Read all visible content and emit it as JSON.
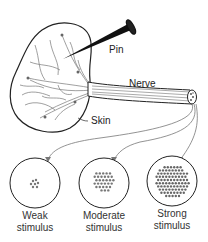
{
  "labels": {
    "pin": "Pin",
    "nerve": "Nerve",
    "skin": "Skin"
  },
  "stimuli": [
    {
      "line1": "Weak",
      "line2": "stimulus"
    },
    {
      "line1": "Moderate",
      "line2": "stimulus"
    },
    {
      "line1": "Strong",
      "line2": "stimulus"
    }
  ],
  "colors": {
    "ink": "#222222",
    "background": "#ffffff",
    "arrow": "#777777"
  }
}
